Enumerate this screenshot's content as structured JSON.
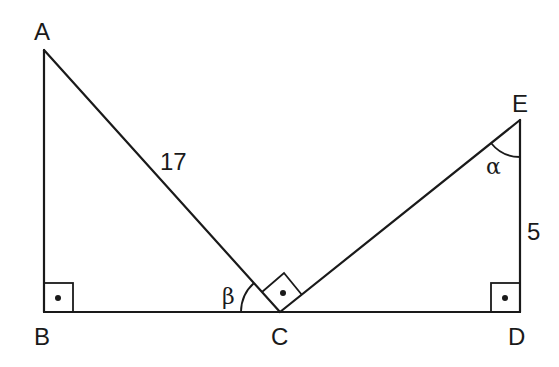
{
  "diagram": {
    "type": "geometry",
    "points": {
      "A": {
        "label": "A",
        "x": 44,
        "y": 50
      },
      "B": {
        "label": "B",
        "x": 44,
        "y": 312
      },
      "C": {
        "label": "C",
        "x": 280,
        "y": 312
      },
      "D": {
        "label": "D",
        "x": 520,
        "y": 312
      },
      "E": {
        "label": "E",
        "x": 520,
        "y": 120
      }
    },
    "segments": [
      {
        "from": "A",
        "to": "B"
      },
      {
        "from": "A",
        "to": "C",
        "length_label": "17"
      },
      {
        "from": "B",
        "to": "D"
      },
      {
        "from": "C",
        "to": "E"
      },
      {
        "from": "E",
        "to": "D",
        "length_label": "5"
      }
    ],
    "labels": {
      "A": "A",
      "B": "B",
      "C": "C",
      "D": "D",
      "E": "E",
      "ac_length": "17",
      "ed_length": "5",
      "angle_beta": "β",
      "angle_alpha": "α"
    },
    "right_angles": [
      "B",
      "C",
      "D"
    ],
    "angles": [
      {
        "vertex": "C",
        "symbol": "β",
        "between": [
          "CA",
          "CB"
        ]
      },
      {
        "vertex": "E",
        "symbol": "α",
        "between": [
          "EC",
          "ED"
        ]
      }
    ]
  }
}
